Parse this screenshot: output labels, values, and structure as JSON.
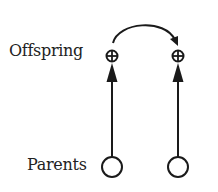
{
  "diagram": {
    "labels": {
      "offspring": "Offspring",
      "parents": "Parents"
    },
    "nodes": [
      {
        "id": "parent-1",
        "row": "parents",
        "shape": "open-circle",
        "x": 112,
        "y": 167
      },
      {
        "id": "parent-2",
        "row": "parents",
        "shape": "open-circle",
        "x": 178,
        "y": 167
      },
      {
        "id": "offspring-1",
        "row": "offspring",
        "shape": "circled-plus",
        "x": 112,
        "y": 56
      },
      {
        "id": "offspring-2",
        "row": "offspring",
        "shape": "circled-plus",
        "x": 178,
        "y": 56
      }
    ],
    "edges": [
      {
        "from": "parent-1",
        "to": "offspring-1",
        "type": "straight-arrow"
      },
      {
        "from": "parent-2",
        "to": "offspring-2",
        "type": "straight-arrow"
      },
      {
        "from": "offspring-1",
        "to": "offspring-2",
        "type": "curved-arrow"
      }
    ],
    "colors": {
      "stroke": "#1a1a1a",
      "text": "#222222",
      "background": "#ffffff"
    }
  }
}
